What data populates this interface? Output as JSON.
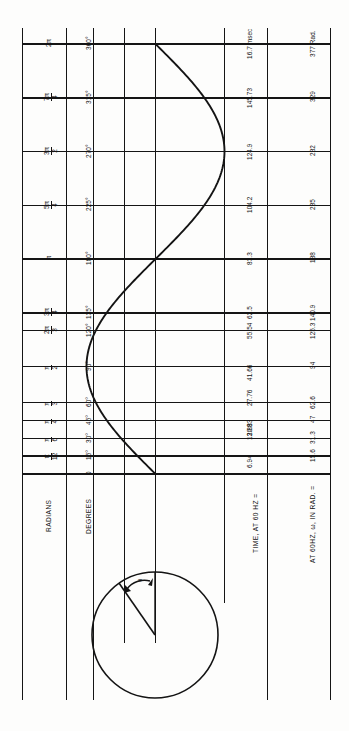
{
  "rows": [
    {
      "id": "radians",
      "label": "RADIANS"
    },
    {
      "id": "degrees",
      "label": "DEGREES"
    },
    {
      "id": "time",
      "label": "TIME, AT 60 HZ ="
    },
    {
      "id": "omega",
      "label": "AT 60HZ, ω, IN RAD. ="
    }
  ],
  "scales": {
    "radians": {
      "name": "RADIANS",
      "unit": "",
      "ticks": [
        {
          "deg": 0,
          "text": ""
        },
        {
          "deg": 15,
          "text": "π/12"
        },
        {
          "deg": 30,
          "text": "π/6"
        },
        {
          "deg": 45,
          "text": "π/4"
        },
        {
          "deg": 60,
          "text": "π/3"
        },
        {
          "deg": 90,
          "text": "π/2"
        },
        {
          "deg": 120,
          "text": "2π/3"
        },
        {
          "deg": 135,
          "text": "3π/4"
        },
        {
          "deg": 180,
          "text": "π"
        },
        {
          "deg": 225,
          "text": "5π/4"
        },
        {
          "deg": 270,
          "text": "3π/2"
        },
        {
          "deg": 315,
          "text": "7π/4"
        },
        {
          "deg": 360,
          "text": "2π"
        }
      ]
    },
    "degrees": {
      "name": "DEGREES",
      "unit": "°",
      "ticks": [
        {
          "deg": 0,
          "text": "0"
        },
        {
          "deg": 15,
          "text": "15°"
        },
        {
          "deg": 30,
          "text": "30°"
        },
        {
          "deg": 45,
          "text": "45°"
        },
        {
          "deg": 60,
          "text": "60°"
        },
        {
          "deg": 90,
          "text": "90°"
        },
        {
          "deg": 120,
          "text": "120°"
        },
        {
          "deg": 135,
          "text": "135°"
        },
        {
          "deg": 180,
          "text": "180°"
        },
        {
          "deg": 225,
          "text": "225°"
        },
        {
          "deg": 270,
          "text": "270°"
        },
        {
          "deg": 315,
          "text": "315°"
        },
        {
          "deg": 360,
          "text": "360°"
        }
      ]
    },
    "time": {
      "name": "TIME, AT 60 HZ =",
      "unit": "msec",
      "ticks": [
        {
          "deg": 15,
          "text": "6.94"
        },
        {
          "deg": 30,
          "text": "13.88"
        },
        {
          "deg": 45,
          "text": "20.83"
        },
        {
          "deg": 60,
          "text": "27.76"
        },
        {
          "deg": 90,
          "text": "41.66"
        },
        {
          "deg": 120,
          "text": "55.54"
        },
        {
          "deg": 135,
          "text": "62.5"
        },
        {
          "deg": 180,
          "text": "83.3"
        },
        {
          "deg": 225,
          "text": "104.2"
        },
        {
          "deg": 270,
          "text": "124.9"
        },
        {
          "deg": 315,
          "text": "145.73"
        },
        {
          "deg": 360,
          "text": "16.7 msec"
        }
      ]
    },
    "omega": {
      "name": "AT 60HZ, ω, IN RAD. =",
      "unit": "Rad.",
      "ticks": [
        {
          "deg": 15,
          "text": "15.6"
        },
        {
          "deg": 30,
          "text": "31.3"
        },
        {
          "deg": 45,
          "text": "47"
        },
        {
          "deg": 60,
          "text": "62.6"
        },
        {
          "deg": 90,
          "text": "94"
        },
        {
          "deg": 120,
          "text": "125.3"
        },
        {
          "deg": 135,
          "text": "140.9"
        },
        {
          "deg": 180,
          "text": "188"
        },
        {
          "deg": 225,
          "text": "235"
        },
        {
          "deg": 270,
          "text": "282"
        },
        {
          "deg": 315,
          "text": "329"
        },
        {
          "deg": 360,
          "text": "377 Rad."
        }
      ]
    }
  },
  "chart_data": {
    "type": "line",
    "title": "",
    "xlabel": "",
    "ylabel": "",
    "x_unit": "degrees",
    "x": [
      0,
      15,
      30,
      45,
      60,
      90,
      120,
      135,
      180,
      225,
      270,
      315,
      360
    ],
    "series": [
      {
        "name": "sine",
        "values": [
          0,
          0.259,
          0.5,
          0.707,
          0.866,
          1.0,
          0.866,
          0.707,
          0,
          -0.707,
          -1.0,
          -0.707,
          0
        ]
      }
    ],
    "xlim": [
      0,
      360
    ],
    "ylim": [
      -1,
      1
    ],
    "grid": true,
    "legend": "none",
    "orientation": "vertical-time-axis",
    "note": "Time axis runs bottom (0°) to top (360°); amplitude runs horizontally."
  },
  "phasor": {
    "name": "rotating-vector-circle",
    "angle_symbol": "θ",
    "description": "Unit circle with radius vector and angle arc"
  }
}
